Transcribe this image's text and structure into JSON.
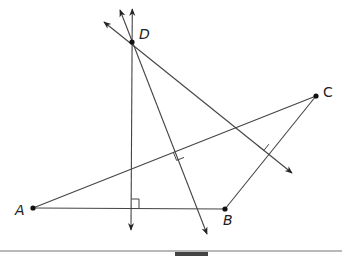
{
  "diagram": {
    "points": {
      "A": {
        "label": "A",
        "x": 33,
        "y": 208
      },
      "B": {
        "label": "B",
        "x": 225,
        "y": 209
      },
      "C": {
        "label": "C",
        "x": 316,
        "y": 96
      },
      "D": {
        "label": "D",
        "x": 132,
        "y": 42
      }
    },
    "segments": [
      "AB",
      "AC",
      "BC"
    ],
    "perpendicular_lines": [
      {
        "through": "D",
        "perpendicular_to": "AB",
        "right_angle_marker": true
      },
      {
        "through": "D",
        "perpendicular_to": "AC",
        "right_angle_marker": true
      },
      {
        "through": "D",
        "perpendicular_to": "BC",
        "right_angle_marker": true
      }
    ],
    "line_color": "#333333",
    "point_color": "#111111"
  },
  "labels": {
    "A": "A",
    "B": "B",
    "C": "C",
    "D": "D"
  }
}
